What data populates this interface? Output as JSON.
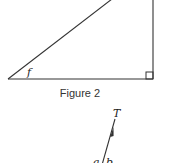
{
  "figure2": {
    "caption": "Figure 2",
    "angle_label": "f",
    "right_angle_marker": true,
    "stroke_color": "#333333"
  },
  "figure3_partial": {
    "vector_label": "T",
    "angle_label_left": "a",
    "angle_label_right": "b"
  }
}
